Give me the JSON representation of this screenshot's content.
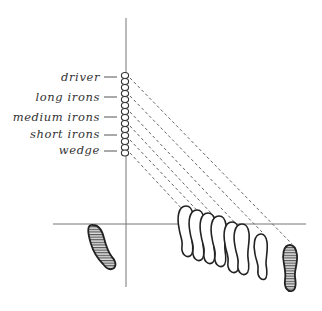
{
  "diagram": {
    "type": "golf ball position vs stance diagram",
    "clubs": [
      {
        "label": "driver",
        "y": 77
      },
      {
        "label": "long irons",
        "y": 97
      },
      {
        "label": "medium irons",
        "y": 117
      },
      {
        "label": "short irons",
        "y": 134
      },
      {
        "label": "wedge",
        "y": 150
      }
    ],
    "axes": {
      "vertical": {
        "x": 126,
        "y1": 18,
        "y2": 287
      },
      "horizontal": {
        "y": 224,
        "x1": 53,
        "x2": 306
      }
    },
    "bead_column": {
      "x": 125,
      "y_top": 73,
      "y_bottom": 155,
      "count": 14
    },
    "dashed_lines": 6,
    "footprints": {
      "left_foot": "hatched, fixed position left of vertical axis",
      "right_foot_positions": 8,
      "rightmost_foot": "hatched"
    },
    "colors": {
      "line": "#777777",
      "ink": "#222222",
      "background": "#ffffff"
    }
  }
}
